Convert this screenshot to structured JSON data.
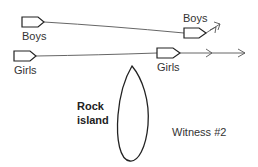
{
  "diagram": {
    "labels": {
      "boys_start": "Boys",
      "girls_start": "Girls",
      "boys_end": "Boys",
      "girls_end": "Girls",
      "island_line1": "Rock",
      "island_line2": "island",
      "witness": "Witness #2"
    },
    "colors": {
      "stroke": "#222222",
      "path": "#555555",
      "text": "#333333",
      "background": "#ffffff"
    }
  }
}
